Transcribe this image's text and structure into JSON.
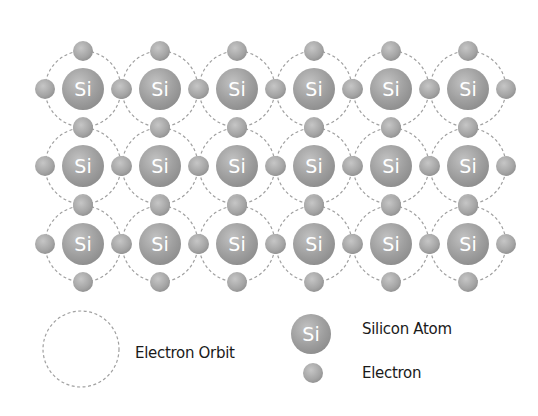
{
  "diagram": {
    "atom_label": "Si",
    "grid": {
      "columns": 6,
      "rows": 3,
      "col_x": [
        83,
        160,
        237,
        314,
        391,
        468
      ],
      "row_y": [
        89,
        166,
        244
      ]
    },
    "colors": {
      "atom_fill": "#9a9a9a",
      "atom_highlight": "#c4c4c4",
      "electron_fill": "#a5a5a5",
      "orbit_stroke": "#a0a0a0",
      "text": "#1a1a1a",
      "background": "#ffffff"
    }
  },
  "legend": {
    "orbit_label": "Electron Orbit",
    "atom_symbol": "Si",
    "atom_label": "Silicon Atom",
    "electron_label": "Electron"
  }
}
